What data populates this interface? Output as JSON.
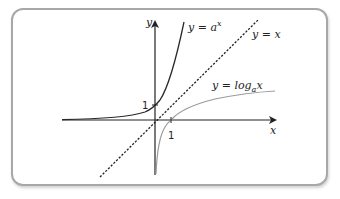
{
  "diagram": {
    "title": "",
    "axes": {
      "x_label": "x",
      "y_label": "y",
      "x_tick": "1",
      "y_tick": "1"
    },
    "curves": [
      {
        "name": "exponential",
        "label_prefix": "y = a",
        "label_sup": "x",
        "color": "#2a2a2a",
        "style": "solid"
      },
      {
        "name": "identity",
        "label": "y = x",
        "color": "#222222",
        "style": "dashed"
      },
      {
        "name": "logarithm",
        "label_prefix": "y = log",
        "label_sub": "a",
        "label_suffix": "x",
        "color": "#9a9a9a",
        "style": "solid"
      }
    ],
    "colors": {
      "frame_border": "#a8a8a8",
      "axis": "#222222",
      "background": "#ffffff"
    }
  }
}
